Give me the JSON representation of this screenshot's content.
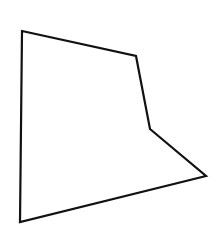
{
  "diagram": {
    "background_color": "#ffffff",
    "shape": {
      "type": "pentagon",
      "stroke_color": "#111111",
      "stroke_width": 2.2,
      "fill": "none",
      "points": [
        {
          "x": 22,
          "y": 31
        },
        {
          "x": 136,
          "y": 56
        },
        {
          "x": 150,
          "y": 129
        },
        {
          "x": 206,
          "y": 176
        },
        {
          "x": 20,
          "y": 222
        }
      ],
      "points_attr": "22,31 136,56 150,129 206,176 20,222"
    }
  }
}
